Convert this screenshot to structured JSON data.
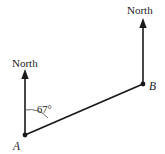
{
  "figure": {
    "type": "bearing-diagram",
    "background_color": "#ffffff",
    "line_color": "#1a1a1a",
    "arc_color": "#5a5a5a",
    "width": 165,
    "height": 154,
    "labels": {
      "north_left": "North",
      "north_right": "North",
      "point_a": "A",
      "point_b": "B",
      "angle": "67°"
    },
    "points": {
      "a": {
        "x": 25,
        "y": 135
      },
      "b": {
        "x": 143,
        "y": 84
      }
    },
    "north_arrow_left": {
      "x": 25,
      "y_tip": 71,
      "y_base": 135
    },
    "north_arrow_right": {
      "x": 143,
      "y_tip": 20,
      "y_base": 84
    },
    "angle_value_degrees": 67,
    "angle_arc_radius": 25
  }
}
